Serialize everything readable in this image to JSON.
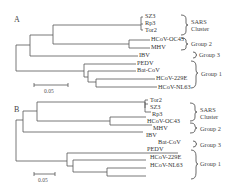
{
  "figure": {
    "panels": [
      {
        "letter": "A",
        "taxa": {
          "sz3": "SZ3",
          "rp3": "Rp3",
          "tor2": "Tor2",
          "oc43": "HCoV-OC43",
          "mhv": "MHV",
          "ibv": "IBV",
          "pedv": "PEDV",
          "batcov": "Bat-CoV",
          "e229": "HCoV-229E",
          "nl63": "HCoV-NL63"
        },
        "groups": {
          "sars_line1": "SARS",
          "sars_line2": "Cluster",
          "group2": "Group 2",
          "group3": "Group 3",
          "group1": "Group 1"
        },
        "scale_bar": "0.05"
      },
      {
        "letter": "B",
        "taxa": {
          "tor2": "Tor2",
          "sz3": "SZ3",
          "rp3": "Rp3",
          "oc43": "HCoV-OC43",
          "mhv": "MHV",
          "ibv": "IBV",
          "batcov": "Bat-CoV",
          "pedv": "PEDV",
          "e229": "HCoV-229E",
          "nl63": "HCoV-NL63"
        },
        "groups": {
          "sars_line1": "SARS",
          "sars_line2": "Cluster",
          "group2": "Group 2",
          "group3": "Group 3",
          "group1": "Group 1"
        },
        "scale_bar": "0.05"
      }
    ]
  }
}
